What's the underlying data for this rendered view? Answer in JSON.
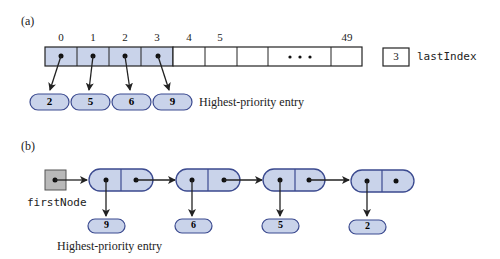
{
  "part_a": {
    "label": "(a)",
    "indices": [
      "0",
      "1",
      "2",
      "3",
      "4",
      "5",
      "",
      "",
      "49"
    ],
    "ellipsis": "• • •",
    "entries": [
      "2",
      "5",
      "6",
      "9"
    ],
    "highest_priority_caption": "Highest-priority entry",
    "last_index_value": "3",
    "last_index_name": "lastIndex"
  },
  "part_b": {
    "label": "(b)",
    "first_node_name": "firstNode",
    "nodes": [
      "9",
      "6",
      "5",
      "2"
    ],
    "highest_priority_caption": "Highest-priority entry"
  },
  "colors": {
    "fill": "#c9d3ea",
    "stroke": "#3b4a8f",
    "head_fill": "#b9b9b9",
    "line": "#222222"
  }
}
